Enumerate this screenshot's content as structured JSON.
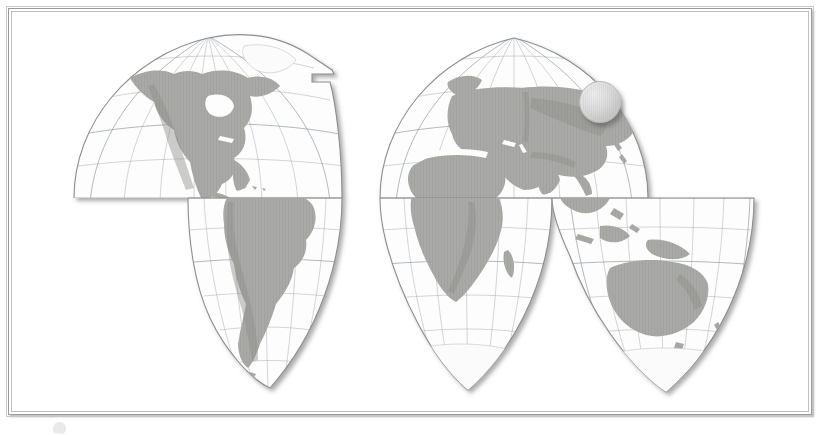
{
  "document": {
    "type": "scanned-map-figure",
    "title": "World map — interrupted Goode homolosine projection",
    "background_color": "#ffffff",
    "frame_color": "#9a9a9a",
    "page_width": 826,
    "page_height": 430
  },
  "frame": {
    "x": 8,
    "y": 8,
    "width": 804,
    "height": 407,
    "border_style": "double-line grey rule with drop shadow",
    "shadow_color": "#787878"
  },
  "map": {
    "projection_name": "Goode homolosine (interrupted)",
    "land_color": "#a9aaa7",
    "ocean_color": "#fdfdfd",
    "graticule_color": "#9aa0a8",
    "graticule_interval_degrees": 15,
    "shadow": "drop shadow beneath each lobe",
    "interruptions_note": "oceanic interruptions split the map into lobes below the equator",
    "lobes": [
      {
        "id": "americas",
        "label": "Americas lobe",
        "central_meridian": -100,
        "features": [
          "North America",
          "Greenland",
          "Central America",
          "Caribbean"
        ]
      },
      {
        "id": "south-america",
        "label": "South America lobe",
        "central_meridian": -60,
        "features": [
          "South America",
          "Andes",
          "Tierra del Fuego"
        ]
      },
      {
        "id": "eurafrica",
        "label": "Europe–Africa–Asia lobe",
        "central_meridian": 20,
        "features": [
          "Europe",
          "Africa",
          "Asia",
          "Siberia",
          "Arabian Peninsula",
          "India",
          "Madagascar"
        ]
      },
      {
        "id": "africa-south",
        "label": "Southern Africa lobe",
        "central_meridian": 20,
        "features": [
          "Southern Africa",
          "Antarctic margin"
        ]
      },
      {
        "id": "asia-pacific",
        "label": "Asia–Australia lobe",
        "central_meridian": 140,
        "features": [
          "Southeast Asia",
          "Indonesia",
          "New Guinea",
          "Australia",
          "New Zealand",
          "Antarctic margin"
        ]
      }
    ],
    "continents": [
      "North America",
      "South America",
      "Europe",
      "Africa",
      "Asia",
      "Australia",
      "Antarctica"
    ]
  },
  "sphere_marker": {
    "shape": "sphere",
    "center_x": 599,
    "center_y": 101,
    "diameter": 42,
    "located_over": "Siberia",
    "fill_color": "#dcdcdc",
    "has_drop_shadow": true
  },
  "caption": {
    "glyph_name": "figure-glyph",
    "note": "faint mark below the frame, clipped by the page edge",
    "opacity": 0.3
  }
}
